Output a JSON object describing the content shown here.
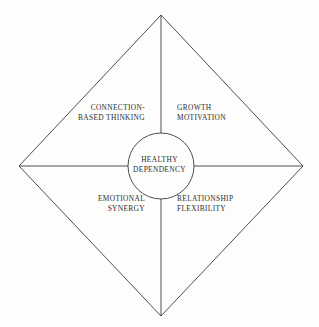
{
  "diagram": {
    "background_color": "#fdfdfc",
    "stroke_color": "#3a3a3c",
    "text_color": "#2c2c2e",
    "center": {
      "name": "healthy-dependency",
      "line1": "HEALTHY",
      "line2": "DEPENDENCY"
    },
    "quadrants": [
      {
        "name": "connection-based-thinking",
        "position": "top-left",
        "line1": "CONNECTION-",
        "line2": "BASED THINKING"
      },
      {
        "name": "growth-motivation",
        "position": "top-right",
        "line1": "GROWTH",
        "line2": "MOTIVATION"
      },
      {
        "name": "emotional-synergy",
        "position": "bottom-left",
        "line1": "EMOTIONAL",
        "line2": "SYNERGY"
      },
      {
        "name": "relationship-flexibility",
        "position": "bottom-right",
        "line1": "RELATIONSHIP",
        "line2": "FLEXIBILITY"
      }
    ],
    "geometry": {
      "top_vertex": [
        161,
        15
      ],
      "right_vertex": [
        303,
        166
      ],
      "bottom_vertex": [
        161,
        316
      ],
      "left_vertex": [
        19,
        166
      ],
      "circle_center": [
        161,
        166
      ],
      "circle_radius": 33
    }
  }
}
